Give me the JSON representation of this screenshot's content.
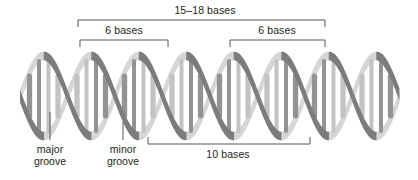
{
  "figure": {
    "colors": {
      "strand_front": "#7c7c7c",
      "strand_back": "#d6d6d6",
      "rung": "#939393",
      "rung_shadow": "#c3c3c3",
      "bracket_line": "#58595b",
      "leader_line": "#58595b",
      "text": "#231f20",
      "background": "#ffffff"
    }
  },
  "brackets": {
    "total": {
      "label": "15–18 bases",
      "label_x": 205,
      "label_y": 4,
      "x1": 78,
      "x2": 325,
      "y": 20,
      "tick": 7
    },
    "left_six": {
      "label": "6 bases",
      "label_x": 124,
      "label_y": 24,
      "x1": 80,
      "x2": 168,
      "y": 40,
      "tick": 7
    },
    "right_six": {
      "label": "6 bases",
      "label_x": 277,
      "label_y": 24,
      "x1": 230,
      "x2": 325,
      "y": 40,
      "tick": 7
    },
    "ten": {
      "label": "10 bases",
      "label_x": 228,
      "label_y": 148,
      "x1": 148,
      "x2": 310,
      "y": 144,
      "tick": 7
    }
  },
  "annotations": {
    "major_groove": {
      "line1": "major",
      "line2": "groove",
      "label_x": 50,
      "label_y": 143,
      "leader_x": 50,
      "leader_y1": 112,
      "leader_y2": 140
    },
    "minor_groove": {
      "line1": "minor",
      "line2": "groove",
      "label_x": 123,
      "label_y": 143,
      "leader_x": 123,
      "leader_y1": 122,
      "leader_y2": 140
    }
  },
  "helix": {
    "x_start": 20,
    "x_end": 400,
    "y_center": 96,
    "amplitude": 40,
    "period": 95,
    "strand_width": 11,
    "phase_offset_deg": 180,
    "rung_count": 40
  }
}
